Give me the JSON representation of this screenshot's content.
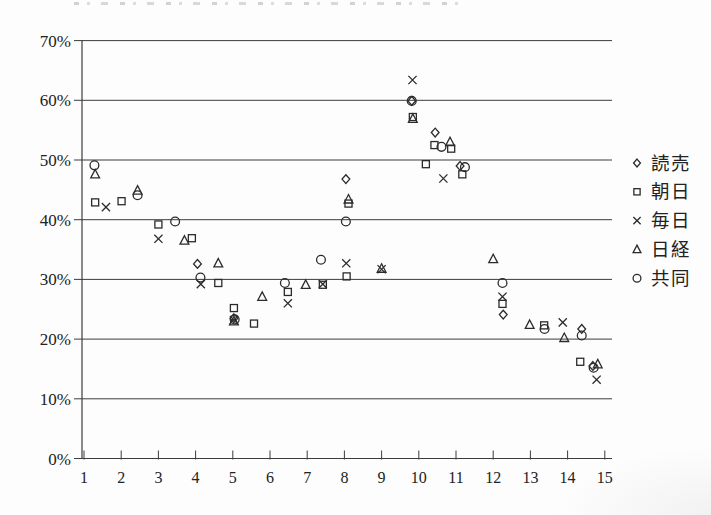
{
  "page": {
    "background": "#fdfdfd"
  },
  "chart_data": {
    "type": "scatter",
    "title": "",
    "xlabel": "",
    "ylabel": "",
    "xlim": [
      1,
      15
    ],
    "ylim": [
      0,
      70
    ],
    "grid": true,
    "legend_position": "right",
    "axis_color": "#3c3c3c",
    "marker_color": "#2b2b2b",
    "x_ticks": [
      "1",
      "2",
      "3",
      "4",
      "5",
      "6",
      "7",
      "8",
      "9",
      "10",
      "11",
      "12",
      "13",
      "14",
      "15"
    ],
    "y_tick_labels": [
      "0%",
      "10%",
      "20%",
      "30%",
      "40%",
      "50%",
      "60%",
      "70%"
    ],
    "legend": [
      {
        "label": "読売",
        "marker": "diamond"
      },
      {
        "label": "朝日",
        "marker": "square"
      },
      {
        "label": "毎日",
        "marker": "x"
      },
      {
        "label": "日経",
        "marker": "triangle"
      },
      {
        "label": "共同",
        "marker": "circle"
      }
    ],
    "series": [
      {
        "name": "読売",
        "marker": "diamond",
        "points": [
          [
            4.05,
            32.6
          ],
          [
            5.03,
            23.5
          ],
          [
            8.04,
            46.8
          ],
          [
            9.81,
            59.9
          ],
          [
            10.44,
            54.6
          ],
          [
            11.11,
            49.0
          ],
          [
            12.27,
            24.1
          ],
          [
            14.38,
            21.7
          ],
          [
            14.68,
            15.5
          ]
        ]
      },
      {
        "name": "朝日",
        "marker": "square",
        "points": [
          [
            1.3,
            42.9
          ],
          [
            2.01,
            43.1
          ],
          [
            3.0,
            39.2
          ],
          [
            3.9,
            36.9
          ],
          [
            4.61,
            29.4
          ],
          [
            5.03,
            25.2
          ],
          [
            5.57,
            22.6
          ],
          [
            6.48,
            27.9
          ],
          [
            7.42,
            29.1
          ],
          [
            8.06,
            30.5
          ],
          [
            8.11,
            42.7
          ],
          [
            9.84,
            57.2
          ],
          [
            10.19,
            49.3
          ],
          [
            10.42,
            52.5
          ],
          [
            10.87,
            51.9
          ],
          [
            11.17,
            47.6
          ],
          [
            12.25,
            25.9
          ],
          [
            13.37,
            22.3
          ],
          [
            14.34,
            16.2
          ]
        ]
      },
      {
        "name": "毎日",
        "marker": "x",
        "points": [
          [
            1.59,
            42.1
          ],
          [
            3.0,
            36.8
          ],
          [
            4.14,
            29.2
          ],
          [
            5.03,
            23.2
          ],
          [
            6.48,
            26.0
          ],
          [
            7.42,
            29.2
          ],
          [
            8.05,
            32.7
          ],
          [
            9.0,
            31.7
          ],
          [
            9.83,
            63.4
          ],
          [
            10.66,
            46.9
          ],
          [
            12.25,
            27.1
          ],
          [
            13.87,
            22.8
          ],
          [
            14.78,
            13.2
          ]
        ]
      },
      {
        "name": "日経",
        "marker": "triangle",
        "points": [
          [
            1.3,
            47.6
          ],
          [
            2.44,
            44.9
          ],
          [
            3.7,
            36.5
          ],
          [
            4.61,
            32.7
          ],
          [
            5.03,
            23.0
          ],
          [
            5.79,
            27.1
          ],
          [
            6.96,
            29.1
          ],
          [
            8.11,
            43.4
          ],
          [
            9.0,
            31.8
          ],
          [
            9.84,
            56.9
          ],
          [
            10.84,
            53.0
          ],
          [
            12.0,
            33.4
          ],
          [
            12.98,
            22.4
          ],
          [
            13.91,
            20.2
          ],
          [
            14.81,
            15.8
          ]
        ]
      },
      {
        "name": "共同",
        "marker": "circle",
        "points": [
          [
            1.28,
            49.1
          ],
          [
            2.44,
            44.1
          ],
          [
            3.45,
            39.7
          ],
          [
            4.13,
            30.3
          ],
          [
            5.05,
            23.3
          ],
          [
            6.4,
            29.4
          ],
          [
            7.37,
            33.3
          ],
          [
            8.04,
            39.7
          ],
          [
            9.81,
            59.9
          ],
          [
            10.61,
            52.2
          ],
          [
            11.24,
            48.8
          ],
          [
            12.25,
            29.4
          ],
          [
            13.38,
            21.7
          ],
          [
            14.38,
            20.6
          ],
          [
            14.7,
            15.2
          ]
        ]
      }
    ]
  }
}
